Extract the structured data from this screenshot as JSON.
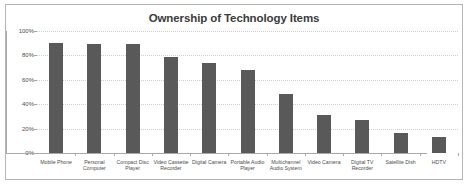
{
  "chart_data": {
    "type": "bar",
    "title": "Ownership of Technology Items",
    "xlabel": "",
    "ylabel": "",
    "ylim": [
      0,
      100
    ],
    "grid": true,
    "legend": "none",
    "ytick_labels": [
      "100%",
      "80%",
      "60%",
      "40%",
      "20%",
      "0%"
    ],
    "ytick_values": [
      100,
      80,
      60,
      40,
      20,
      0
    ],
    "categories": [
      "Mobile Phone",
      "Personal Computer",
      "Compact Disc Player",
      "Video Cassette Recorder",
      "Digital Camera",
      "Portable Audio Player",
      "Multichannel Audio System",
      "Video Camera",
      "Digital TV Recorder",
      "Satellite Dish",
      "HDTV"
    ],
    "values": [
      90,
      89,
      89,
      79,
      74,
      68,
      48,
      31,
      27,
      16,
      13
    ],
    "bar_color": "#595959",
    "gridline_color": "#c8cfd6",
    "axis_color": "#a9a9a9",
    "text_color": "#4d4d4d",
    "title_color": "#3b3b3b",
    "border_color": "#b4b4b4",
    "background_color": "#ffffff"
  }
}
